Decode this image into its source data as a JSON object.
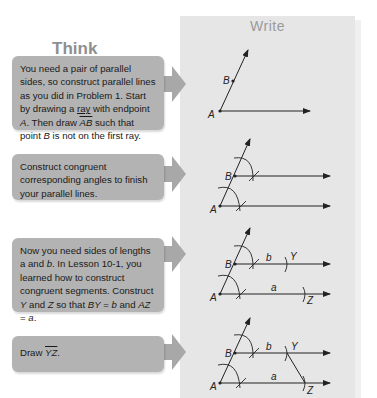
{
  "panels": {
    "think_title": "Think",
    "write_title": "Write"
  },
  "steps": [
    {
      "text_parts": [
        "You need a pair of parallel sides, so construct parallel lines as you did in Problem 1. Start by drawing a ",
        "ray",
        " with endpoint ",
        "A",
        ". Then draw ",
        "AB",
        " such that point ",
        "B",
        " is not on the first ray."
      ]
    },
    {
      "text_parts": [
        "Construct congruent corresponding angles to finish your parallel lines."
      ]
    },
    {
      "text_parts": [
        "Now you need sides of lengths a and ",
        "b",
        ". In Lesson 10-1, you learned how to construct congruent segments. Construct ",
        "Y",
        " and ",
        "Z",
        " so that ",
        "BY",
        " = ",
        "b",
        " and ",
        "AZ",
        " = ",
        "a",
        "."
      ]
    },
    {
      "text_parts": [
        "Draw ",
        "YZ",
        "."
      ]
    }
  ],
  "diagram_labels": {
    "A": "A",
    "B": "B",
    "Y": "Y",
    "Z": "Z",
    "a": "a",
    "b": "b"
  },
  "colors": {
    "panel_bg": "#e6e6e6",
    "box_bg": "#b3b3b3",
    "arrow": "#a8a8a8",
    "line": "#222222"
  }
}
